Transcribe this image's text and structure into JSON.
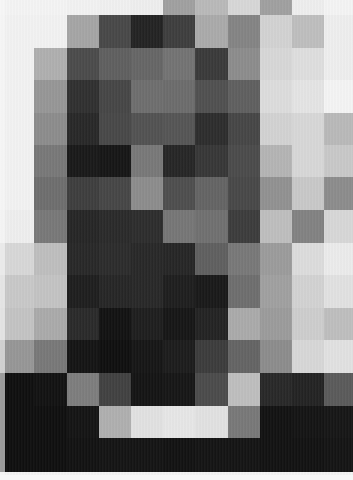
{
  "image": {
    "description": "Pixelated grayscale mosaic portrait (11 columns x 15 rows of square tiles)",
    "width": 353,
    "height": 480,
    "columns": 11,
    "rows": 15,
    "col_edges": [
      0,
      34,
      67,
      99,
      131,
      163,
      195,
      228,
      260,
      292,
      324,
      353
    ],
    "row_edges": [
      0,
      15,
      48,
      80,
      113,
      145,
      177,
      210,
      243,
      275,
      308,
      340,
      373,
      406,
      438,
      472
    ],
    "palette_note": "gray values 0-255 per tile, row-major",
    "tiles": [
      [
        244,
        244,
        242,
        240,
        238,
        160,
        185,
        215,
        160,
        238,
        244
      ],
      [
        242,
        242,
        165,
        72,
        35,
        62,
        170,
        132,
        210,
        190,
        238
      ],
      [
        242,
        175,
        75,
        95,
        102,
        115,
        58,
        140,
        215,
        222,
        238
      ],
      [
        242,
        150,
        48,
        70,
        110,
        108,
        80,
        95,
        220,
        228,
        244
      ],
      [
        242,
        140,
        40,
        72,
        82,
        85,
        45,
        70,
        210,
        215,
        185
      ],
      [
        242,
        120,
        25,
        22,
        120,
        38,
        55,
        75,
        180,
        215,
        200
      ],
      [
        242,
        110,
        62,
        70,
        140,
        78,
        100,
        72,
        145,
        200,
        140
      ],
      [
        238,
        120,
        38,
        42,
        45,
        118,
        112,
        60,
        190,
        130,
        215
      ],
      [
        215,
        190,
        40,
        44,
        40,
        38,
        95,
        120,
        155,
        220,
        235
      ],
      [
        200,
        195,
        30,
        38,
        40,
        30,
        25,
        110,
        160,
        210,
        225
      ],
      [
        195,
        170,
        42,
        18,
        30,
        22,
        35,
        170,
        155,
        205,
        190
      ],
      [
        150,
        120,
        20,
        15,
        22,
        28,
        60,
        100,
        140,
        215,
        225
      ],
      [
        15,
        18,
        125,
        65,
        20,
        22,
        75,
        190,
        40,
        35,
        90
      ],
      [
        15,
        15,
        20,
        175,
        225,
        230,
        225,
        120,
        18,
        20,
        22
      ],
      [
        15,
        15,
        18,
        20,
        20,
        18,
        20,
        20,
        18,
        18,
        20
      ]
    ]
  }
}
